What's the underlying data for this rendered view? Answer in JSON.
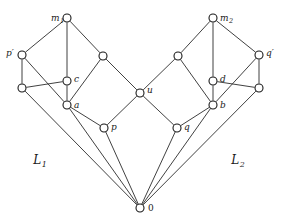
{
  "figure": {
    "type": "hasse-diagram",
    "title": "",
    "width": 282,
    "height": 224,
    "background_color": "#ffffff",
    "edge_color": "#2b2b2b",
    "node_fill_color": "#ffffff",
    "node_stroke_color": "#1a1a1a",
    "node_radius": 4
  },
  "nodes": [
    {
      "id": "m1",
      "label": "m",
      "sub": "1",
      "x": 67,
      "y": 18,
      "label_dx": -16,
      "label_dy": 3,
      "labeled": true
    },
    {
      "id": "m2",
      "label": "m",
      "sub": "2",
      "x": 213,
      "y": 18,
      "label_dx": 7,
      "label_dy": 3,
      "labeled": true
    },
    {
      "id": "pp",
      "label": "p′",
      "sub": "",
      "x": 22,
      "y": 55,
      "label_dx": -16,
      "label_dy": 1,
      "labeled": true
    },
    {
      "id": "qp",
      "label": "q′",
      "sub": "",
      "x": 259,
      "y": 55,
      "label_dx": 7,
      "label_dy": 1,
      "labeled": true
    },
    {
      "id": "n1",
      "label": "",
      "sub": "",
      "x": 103,
      "y": 56,
      "label_dx": 0,
      "label_dy": 0,
      "labeled": false
    },
    {
      "id": "n2",
      "label": "",
      "sub": "",
      "x": 178,
      "y": 56,
      "label_dx": 0,
      "label_dy": 0,
      "labeled": false
    },
    {
      "id": "c",
      "label": "c",
      "sub": "",
      "x": 67,
      "y": 81,
      "label_dx": 7,
      "label_dy": 1,
      "labeled": true
    },
    {
      "id": "d",
      "label": "d",
      "sub": "",
      "x": 213,
      "y": 81,
      "label_dx": 7,
      "label_dy": 1,
      "labeled": true
    },
    {
      "id": "n3",
      "label": "",
      "sub": "",
      "x": 22,
      "y": 88,
      "label_dx": 0,
      "label_dy": 0,
      "labeled": false
    },
    {
      "id": "n4",
      "label": "",
      "sub": "",
      "x": 259,
      "y": 88,
      "label_dx": 0,
      "label_dy": 0,
      "labeled": false
    },
    {
      "id": "u",
      "label": "u",
      "sub": "",
      "x": 140,
      "y": 93,
      "label_dx": 7,
      "label_dy": 0,
      "labeled": true
    },
    {
      "id": "a",
      "label": "a",
      "sub": "",
      "x": 67,
      "y": 105,
      "label_dx": 7,
      "label_dy": 3,
      "labeled": true
    },
    {
      "id": "b",
      "label": "b",
      "sub": "",
      "x": 213,
      "y": 105,
      "label_dx": 7,
      "label_dy": 3,
      "labeled": true
    },
    {
      "id": "p",
      "label": "p",
      "sub": "",
      "x": 104,
      "y": 128,
      "label_dx": 7,
      "label_dy": 2,
      "labeled": true
    },
    {
      "id": "q",
      "label": "q",
      "sub": "",
      "x": 177,
      "y": 128,
      "label_dx": 7,
      "label_dy": 2,
      "labeled": true
    },
    {
      "id": "zero",
      "label": "0",
      "sub": "",
      "x": 140,
      "y": 208,
      "label_dx": 8,
      "label_dy": 3,
      "labeled": true,
      "upright": true
    }
  ],
  "edges": [
    {
      "from": "m1",
      "to": "pp"
    },
    {
      "from": "m1",
      "to": "c"
    },
    {
      "from": "m1",
      "to": "n1"
    },
    {
      "from": "pp",
      "to": "n3"
    },
    {
      "from": "pp",
      "to": "a"
    },
    {
      "from": "c",
      "to": "n3"
    },
    {
      "from": "c",
      "to": "a"
    },
    {
      "from": "n1",
      "to": "a"
    },
    {
      "from": "n1",
      "to": "u"
    },
    {
      "from": "n3",
      "to": "zero"
    },
    {
      "from": "a",
      "to": "zero"
    },
    {
      "from": "u",
      "to": "p"
    },
    {
      "from": "p",
      "to": "a"
    },
    {
      "from": "p",
      "to": "zero"
    },
    {
      "from": "m2",
      "to": "qp"
    },
    {
      "from": "m2",
      "to": "d"
    },
    {
      "from": "m2",
      "to": "n2"
    },
    {
      "from": "qp",
      "to": "n4"
    },
    {
      "from": "qp",
      "to": "b"
    },
    {
      "from": "d",
      "to": "n4"
    },
    {
      "from": "d",
      "to": "b"
    },
    {
      "from": "n2",
      "to": "b"
    },
    {
      "from": "n2",
      "to": "u"
    },
    {
      "from": "n4",
      "to": "zero"
    },
    {
      "from": "b",
      "to": "zero"
    },
    {
      "from": "u",
      "to": "q"
    },
    {
      "from": "q",
      "to": "b"
    },
    {
      "from": "q",
      "to": "zero"
    }
  ],
  "region_labels": [
    {
      "id": "L1",
      "label": "L",
      "sub": "1",
      "x": 40,
      "y": 164
    },
    {
      "id": "L2",
      "label": "L",
      "sub": "2",
      "x": 238,
      "y": 164
    }
  ]
}
